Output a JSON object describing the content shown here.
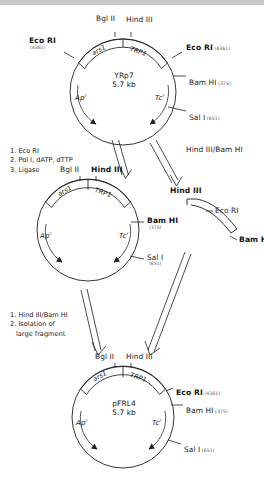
{
  "figure": {
    "topbar_color": "#c8c8c8"
  },
  "plasmid_top": {
    "name": "YRp7",
    "size": "5.7 kb",
    "genes": {
      "ars": "ars1",
      "trp": "TRP1",
      "amp": "Ap",
      "amp_sup": "r",
      "tet": "Tc",
      "tet_sup": "r"
    },
    "sites": {
      "bgl2": "Bgl II",
      "hind3": "Hind III",
      "eco_left": "Eco RI",
      "eco_left_pos": "(4361)",
      "eco_right": "Eco RI",
      "eco_right_pos": "(4361)",
      "bam": "Bam HI",
      "bam_pos": "(375)",
      "sal": "Sal I",
      "sal_pos": "(651)"
    }
  },
  "steps_one": {
    "line1": "1. Eco RI",
    "line2": "2. Pol I, dATP, dTTP",
    "line3": "3. Ligase"
  },
  "arrow_right_label": "Hind III/Bam HI",
  "plasmid_mid": {
    "genes": {
      "ars": "ars1",
      "trp": "TRP1",
      "amp": "Ap",
      "amp_sup": "r",
      "tet": "Tc",
      "tet_sup": "r"
    },
    "sites": {
      "bgl2": "Bgl II",
      "hind3": "Hind III",
      "bam": "Bam HI",
      "bam_pos": "(375)",
      "sal": "Sal I",
      "sal_pos": "(651)"
    }
  },
  "fragment": {
    "hind3": "Hind III",
    "eco": "Eco RI",
    "bam": "Bam HI"
  },
  "steps_two": {
    "line1": "1. Hind III/Bam HI",
    "line2": "2. Isolation of",
    "line3": "large fragment"
  },
  "plasmid_bottom": {
    "name": "pFRL4",
    "size": "5.7 kb",
    "genes": {
      "ars": "ars1",
      "trp": "TRP1",
      "amp": "Ap",
      "amp_sup": "r",
      "tet": "Tc",
      "tet_sup": "r"
    },
    "sites": {
      "bgl2": "Bgl II",
      "hind3": "Hind III",
      "eco": "Eco RI",
      "eco_pos": "(4361)",
      "bam": "Bam HI",
      "bam_pos": "(375)",
      "sal": "Sal I",
      "sal_pos": "(651)"
    }
  }
}
